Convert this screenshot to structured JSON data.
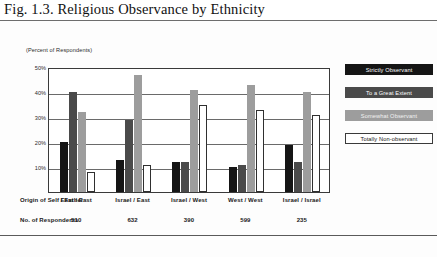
{
  "figure": {
    "caption": "Fig. 1.3. Religious Observance by Ethnicity",
    "unit_label": "(Percent of Respondents)"
  },
  "table_rows": {
    "origin_header": "Origin of Self / Father",
    "count_header": "No. of Respondents"
  },
  "chart_data": {
    "type": "bar",
    "title": "Fig. 1.3. Religious Observance by Ethnicity",
    "subtitle": "(Percent of Respondents)",
    "xlabel": "Origin of Self / Father",
    "ylabel": "",
    "ylim": [
      0,
      50
    ],
    "yticks": [
      10,
      20,
      30,
      40,
      50
    ],
    "ytick_labels": [
      "10%",
      "20%",
      "30%",
      "40%",
      "50%"
    ],
    "grid": true,
    "legend_position": "right",
    "categories": [
      "East / East",
      "Israel / East",
      "Israel / West",
      "West / West",
      "Israel / Israel"
    ],
    "respondents": [
      510,
      632,
      390,
      599,
      235
    ],
    "series": [
      {
        "name": "Strictly Observant",
        "color": "#151515",
        "values": [
          20,
          13,
          12,
          10,
          19
        ]
      },
      {
        "name": "To a Great Extent",
        "color": "#4a4a4a",
        "values": [
          40,
          29,
          12,
          11,
          12
        ]
      },
      {
        "name": "Somewhat Observant",
        "color": "#9d9d9d",
        "values": [
          32,
          47,
          41,
          43,
          40
        ]
      },
      {
        "name": "Totally Non-observant",
        "color": "#ffffff",
        "values": [
          8,
          11,
          35,
          33,
          31
        ]
      }
    ]
  }
}
